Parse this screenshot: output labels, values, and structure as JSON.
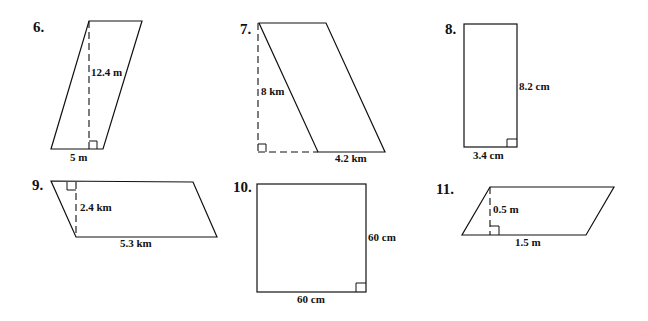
{
  "problems": [
    {
      "number": "6.",
      "shape": "parallelogram",
      "height": "12.4 m",
      "base": "5 m"
    },
    {
      "number": "7.",
      "shape": "parallelogram",
      "height": "8 km",
      "base": "4.2 km"
    },
    {
      "number": "8.",
      "shape": "rectangle",
      "height": "8.2 cm",
      "base": "3.4 cm"
    },
    {
      "number": "9.",
      "shape": "parallelogram",
      "height": "2.4 km",
      "base": "5.3 km"
    },
    {
      "number": "10.",
      "shape": "square",
      "height": "60 cm",
      "base": "60 cm"
    },
    {
      "number": "11.",
      "shape": "parallelogram",
      "height": "0.5 m",
      "base": "1.5 m"
    }
  ]
}
